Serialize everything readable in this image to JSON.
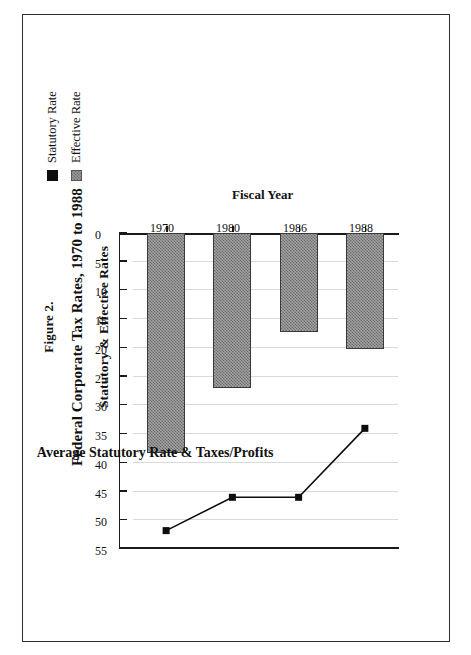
{
  "figure": {
    "figure_label": "Figure 2.",
    "title": "Federal Corporate Tax Rates, 1970 to 1988",
    "subtitle": "Statutory & Effective Rates"
  },
  "legend": {
    "position": "top-right",
    "items": [
      {
        "label": "Statutory Rate",
        "key": "filled-square-marker",
        "color": "#0d0d0d"
      },
      {
        "label": "Effective Rate",
        "key": "hatched-square-swatch",
        "color": "#9a9a9a"
      }
    ]
  },
  "chart_data": {
    "type": "bar",
    "title": "Federal Corporate Tax Rates, 1970 to 1988",
    "subtitle": "Statutory & Effective Rates",
    "orientation": "vertical",
    "categories": [
      "1970",
      "1980",
      "1986",
      "1988"
    ],
    "xlabel": "Fiscal Year",
    "ylabel": "Average Statutory Rate & Taxes/Profits",
    "ylim": [
      0,
      55
    ],
    "ytick_labels": [
      "55",
      "50",
      "45",
      "40",
      "35",
      "30",
      "25",
      "20",
      "15",
      "10",
      "5",
      "0"
    ],
    "ytick_values": [
      55,
      50,
      45,
      40,
      35,
      30,
      25,
      20,
      15,
      10,
      5,
      0
    ],
    "grid": "value-axis gridlines only",
    "series": [
      {
        "name": "Effective Rate",
        "render": "bar",
        "fill": "#9a9a9a",
        "values": [
          38.3,
          27.0,
          17.3,
          20.2
        ]
      },
      {
        "name": "Statutory Rate",
        "render": "line-with-square-markers",
        "color": "#0d0d0d",
        "values": [
          51.8,
          46.0,
          46.0,
          34.0
        ]
      }
    ]
  }
}
